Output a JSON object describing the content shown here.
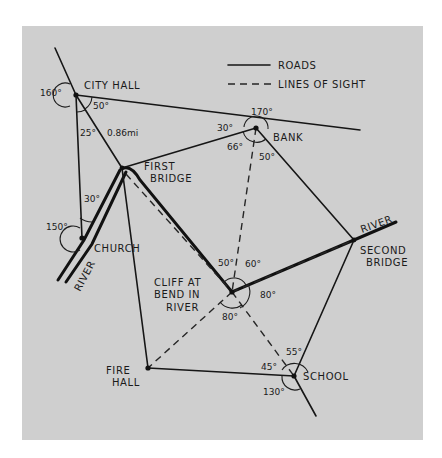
{
  "legend": {
    "roads_label": "ROADS",
    "sight_label": "LINES OF SIGHT"
  },
  "places": {
    "city_hall": "CITY HALL",
    "bank": "BANK",
    "first_bridge_1": "FIRST",
    "first_bridge_2": "BRIDGE",
    "church": "CHURCH",
    "cliff_1": "CLIFF AT",
    "cliff_2": "BEND IN",
    "cliff_3": "RIVER",
    "second_bridge_1": "SECOND",
    "second_bridge_2": "BRIDGE",
    "fire_hall_1": "FIRE",
    "fire_hall_2": "HALL",
    "school": "SCHOOL",
    "river_left": "RIVER",
    "river_right": "RIVER"
  },
  "distance": "0.86mi",
  "angles": {
    "city_hall_outer": "160°",
    "city_hall_50": "50°",
    "city_hall_25": "25°",
    "bank_top": "170°",
    "bank_30": "30°",
    "bank_66": "66°",
    "bank_50": "50°",
    "church_30": "30°",
    "church_outer": "150°",
    "cliff_50": "50°",
    "cliff_60": "60°",
    "cliff_right": "80°",
    "cliff_bottom": "80°",
    "school_55": "55°",
    "school_45": "45°",
    "school_130": "130°"
  }
}
